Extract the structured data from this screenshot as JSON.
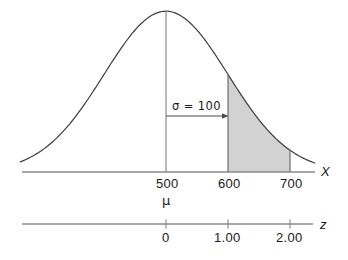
{
  "chart_data": {
    "type": "line",
    "title": "",
    "xlabel": "X",
    "ylabel": "",
    "distribution": "normal",
    "mean": 500,
    "sigma": 100,
    "axes": [
      {
        "name": "X",
        "label": "X",
        "tick_labels": [
          "500",
          "600",
          "700"
        ],
        "tick_values": [
          500,
          600,
          700
        ],
        "sub_labels": [
          {
            "text": "μ",
            "under": "500"
          }
        ]
      },
      {
        "name": "z",
        "label": "z",
        "tick_labels": [
          "0",
          "1.00",
          "2.00"
        ],
        "tick_values": [
          0,
          1.0,
          2.0
        ]
      }
    ],
    "annotations": [
      {
        "name": "sigma-arrow",
        "text": "σ = 100",
        "from_x": 500,
        "to_x": 600,
        "arrow": "right"
      }
    ],
    "shaded_region": {
      "from_x": 600,
      "to_x": 700,
      "from_z": 1.0,
      "to_z": 2.0,
      "fill": "#d2d2d2"
    },
    "grid": false,
    "legend": null
  },
  "labels": {
    "x_axis_name": "X",
    "z_axis_name": "z",
    "x_tick_500": "500",
    "x_tick_600": "600",
    "x_tick_700": "700",
    "mu_symbol": "μ",
    "z_tick_0": "0",
    "z_tick_1": "1.00",
    "z_tick_2": "2.00",
    "sigma_annotation": "σ = 100"
  },
  "colors": {
    "curve": "#3c3c3c",
    "axis": "#8a8a8a",
    "shade": "#d2d2d2",
    "text": "#1a1a1a"
  }
}
